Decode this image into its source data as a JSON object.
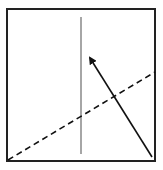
{
  "diagram": {
    "width": 163,
    "height": 170,
    "background": "#ffffff",
    "frame": {
      "x": 7,
      "y": 9,
      "width": 148,
      "height": 152,
      "stroke": "#222222",
      "stroke_width": 2
    },
    "vertical_line": {
      "x1": 81,
      "y1": 17,
      "x2": 81,
      "y2": 154,
      "stroke": "#888888",
      "stroke_width": 1.5
    },
    "dashed_line": {
      "x1": 8,
      "y1": 160,
      "x2": 155,
      "y2": 72,
      "stroke": "#111111",
      "stroke_width": 1.6,
      "dash": "6,4"
    },
    "arrow": {
      "x1": 152,
      "y1": 157,
      "x2": 90,
      "y2": 58,
      "stroke": "#111111",
      "stroke_width": 1.6,
      "head": "filled-triangle"
    }
  }
}
